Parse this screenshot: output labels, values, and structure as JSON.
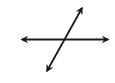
{
  "diagram": {
    "background": "#ffffff",
    "stroke_color": "#1a1a1a",
    "lines": [
      {
        "name": "horizontal-line",
        "x1": 22,
        "y1": 39.5,
        "x2": 108,
        "y2": 39.5,
        "arrow_start": true,
        "arrow_end": true
      },
      {
        "name": "diagonal-line",
        "x1": 82,
        "y1": 8,
        "x2": 47,
        "y2": 71,
        "arrow_start": true,
        "arrow_end": true
      }
    ]
  }
}
